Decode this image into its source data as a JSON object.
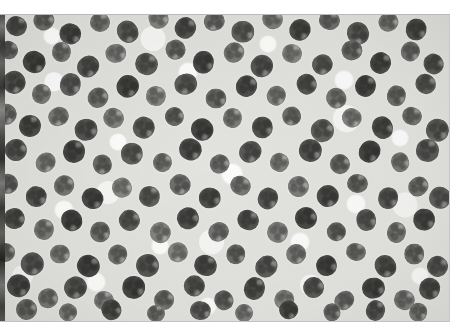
{
  "figure": {
    "kind": "micrograph",
    "modality": "light-microscopy-grayscale",
    "caption": "",
    "title": "",
    "visible_text": "",
    "colors": {
      "page_background": "#ffffff",
      "plate_background": "#e6e6e3",
      "cell_dark": "#4a4a48",
      "cell_mid": "#6f6f6c",
      "cell_light": "#949491",
      "cell_core": "#3a3a38",
      "halo_white": "#ffffff",
      "left_artifact_dark": "#262626",
      "plate_border": "#c2c2bf"
    },
    "plate": {
      "x": 0,
      "y": 14,
      "width": 450,
      "height": 308
    },
    "margins": {
      "top": 14,
      "right": 15,
      "bottom": 14,
      "left": 0
    }
  },
  "cells": [
    {
      "x": 16,
      "y": 12,
      "r": 11,
      "tone": 0.82,
      "rot": 18
    },
    {
      "x": 44,
      "y": 6,
      "r": 10,
      "tone": 0.74,
      "rot": 61
    },
    {
      "x": 70,
      "y": 20,
      "r": 11,
      "tone": 0.86,
      "rot": 110
    },
    {
      "x": 100,
      "y": 8,
      "r": 10,
      "tone": 0.7,
      "rot": 5
    },
    {
      "x": 128,
      "y": 18,
      "r": 11,
      "tone": 0.8,
      "rot": 143
    },
    {
      "x": 158,
      "y": 4,
      "r": 10,
      "tone": 0.66,
      "rot": 77
    },
    {
      "x": 186,
      "y": 14,
      "r": 11,
      "tone": 0.84,
      "rot": 29
    },
    {
      "x": 214,
      "y": 7,
      "r": 10,
      "tone": 0.72,
      "rot": 165
    },
    {
      "x": 243,
      "y": 18,
      "r": 11,
      "tone": 0.78,
      "rot": 92
    },
    {
      "x": 272,
      "y": 5,
      "r": 10,
      "tone": 0.68,
      "rot": 40
    },
    {
      "x": 300,
      "y": 16,
      "r": 11,
      "tone": 0.86,
      "rot": 124
    },
    {
      "x": 330,
      "y": 6,
      "r": 10,
      "tone": 0.73,
      "rot": 14
    },
    {
      "x": 358,
      "y": 19,
      "r": 11,
      "tone": 0.81,
      "rot": 152
    },
    {
      "x": 388,
      "y": 8,
      "r": 10,
      "tone": 0.69,
      "rot": 68
    },
    {
      "x": 416,
      "y": 16,
      "r": 11,
      "tone": 0.85,
      "rot": 101
    },
    {
      "x": 8,
      "y": 36,
      "r": 10,
      "tone": 0.76,
      "rot": 33
    },
    {
      "x": 34,
      "y": 48,
      "r": 11,
      "tone": 0.88,
      "rot": 119
    },
    {
      "x": 62,
      "y": 38,
      "r": 10,
      "tone": 0.71,
      "rot": 7
    },
    {
      "x": 88,
      "y": 52,
      "r": 11,
      "tone": 0.83,
      "rot": 136
    },
    {
      "x": 116,
      "y": 40,
      "r": 10,
      "tone": 0.67,
      "rot": 84
    },
    {
      "x": 146,
      "y": 50,
      "r": 11,
      "tone": 0.8,
      "rot": 22
    },
    {
      "x": 176,
      "y": 36,
      "r": 10,
      "tone": 0.74,
      "rot": 158
    },
    {
      "x": 204,
      "y": 48,
      "r": 11,
      "tone": 0.87,
      "rot": 95
    },
    {
      "x": 234,
      "y": 38,
      "r": 10,
      "tone": 0.7,
      "rot": 46
    },
    {
      "x": 262,
      "y": 52,
      "r": 11,
      "tone": 0.82,
      "rot": 131
    },
    {
      "x": 292,
      "y": 40,
      "r": 10,
      "tone": 0.65,
      "rot": 11
    },
    {
      "x": 322,
      "y": 50,
      "r": 11,
      "tone": 0.79,
      "rot": 148
    },
    {
      "x": 352,
      "y": 36,
      "r": 10,
      "tone": 0.75,
      "rot": 73
    },
    {
      "x": 380,
      "y": 49,
      "r": 11,
      "tone": 0.86,
      "rot": 27
    },
    {
      "x": 410,
      "y": 38,
      "r": 10,
      "tone": 0.72,
      "rot": 114
    },
    {
      "x": 434,
      "y": 50,
      "r": 11,
      "tone": 0.81,
      "rot": 59
    },
    {
      "x": 14,
      "y": 68,
      "r": 11,
      "tone": 0.84,
      "rot": 140
    },
    {
      "x": 42,
      "y": 80,
      "r": 10,
      "tone": 0.69,
      "rot": 16
    },
    {
      "x": 70,
      "y": 70,
      "r": 11,
      "tone": 0.78,
      "rot": 103
    },
    {
      "x": 98,
      "y": 84,
      "r": 10,
      "tone": 0.73,
      "rot": 51
    },
    {
      "x": 128,
      "y": 72,
      "r": 11,
      "tone": 0.88,
      "rot": 127
    },
    {
      "x": 156,
      "y": 82,
      "r": 10,
      "tone": 0.66,
      "rot": 9
    },
    {
      "x": 186,
      "y": 70,
      "r": 11,
      "tone": 0.8,
      "rot": 163
    },
    {
      "x": 216,
      "y": 84,
      "r": 10,
      "tone": 0.75,
      "rot": 88
    },
    {
      "x": 246,
      "y": 72,
      "r": 11,
      "tone": 0.85,
      "rot": 35
    },
    {
      "x": 276,
      "y": 82,
      "r": 10,
      "tone": 0.68,
      "rot": 118
    },
    {
      "x": 306,
      "y": 70,
      "r": 11,
      "tone": 0.82,
      "rot": 64
    },
    {
      "x": 336,
      "y": 84,
      "r": 10,
      "tone": 0.71,
      "rot": 145
    },
    {
      "x": 366,
      "y": 72,
      "r": 11,
      "tone": 0.87,
      "rot": 21
    },
    {
      "x": 396,
      "y": 82,
      "r": 10,
      "tone": 0.74,
      "rot": 98
    },
    {
      "x": 426,
      "y": 70,
      "r": 11,
      "tone": 0.79,
      "rot": 42
    },
    {
      "x": 6,
      "y": 100,
      "r": 10,
      "tone": 0.72,
      "rot": 130
    },
    {
      "x": 30,
      "y": 112,
      "r": 11,
      "tone": 0.86,
      "rot": 6
    },
    {
      "x": 58,
      "y": 102,
      "r": 10,
      "tone": 0.7,
      "rot": 155
    },
    {
      "x": 86,
      "y": 116,
      "r": 11,
      "tone": 0.83,
      "rot": 80
    },
    {
      "x": 114,
      "y": 104,
      "r": 10,
      "tone": 0.67,
      "rot": 26
    },
    {
      "x": 144,
      "y": 114,
      "r": 11,
      "tone": 0.81,
      "rot": 112
    },
    {
      "x": 174,
      "y": 102,
      "r": 10,
      "tone": 0.76,
      "rot": 57
    },
    {
      "x": 202,
      "y": 116,
      "r": 11,
      "tone": 0.88,
      "rot": 138
    },
    {
      "x": 232,
      "y": 104,
      "r": 10,
      "tone": 0.69,
      "rot": 13
    },
    {
      "x": 262,
      "y": 114,
      "r": 11,
      "tone": 0.84,
      "rot": 91
    },
    {
      "x": 292,
      "y": 102,
      "r": 10,
      "tone": 0.73,
      "rot": 167
    },
    {
      "x": 322,
      "y": 116,
      "r": 11,
      "tone": 0.78,
      "rot": 48
    },
    {
      "x": 352,
      "y": 104,
      "r": 10,
      "tone": 0.66,
      "rot": 123
    },
    {
      "x": 382,
      "y": 114,
      "r": 11,
      "tone": 0.85,
      "rot": 70
    },
    {
      "x": 412,
      "y": 102,
      "r": 10,
      "tone": 0.71,
      "rot": 19
    },
    {
      "x": 438,
      "y": 116,
      "r": 11,
      "tone": 0.8,
      "rot": 106
    },
    {
      "x": 16,
      "y": 136,
      "r": 11,
      "tone": 0.82,
      "rot": 53
    },
    {
      "x": 46,
      "y": 148,
      "r": 10,
      "tone": 0.68,
      "rot": 134
    },
    {
      "x": 74,
      "y": 138,
      "r": 11,
      "tone": 0.87,
      "rot": 10
    },
    {
      "x": 102,
      "y": 150,
      "r": 10,
      "tone": 0.75,
      "rot": 160
    },
    {
      "x": 132,
      "y": 140,
      "r": 11,
      "tone": 0.79,
      "rot": 85
    },
    {
      "x": 162,
      "y": 148,
      "r": 10,
      "tone": 0.7,
      "rot": 31
    },
    {
      "x": 190,
      "y": 136,
      "r": 11,
      "tone": 0.86,
      "rot": 117
    },
    {
      "x": 220,
      "y": 150,
      "r": 10,
      "tone": 0.72,
      "rot": 62
    },
    {
      "x": 250,
      "y": 138,
      "r": 11,
      "tone": 0.81,
      "rot": 143
    },
    {
      "x": 280,
      "y": 148,
      "r": 10,
      "tone": 0.67,
      "rot": 24
    },
    {
      "x": 310,
      "y": 136,
      "r": 11,
      "tone": 0.84,
      "rot": 100
    },
    {
      "x": 340,
      "y": 150,
      "r": 10,
      "tone": 0.74,
      "rot": 45
    },
    {
      "x": 370,
      "y": 138,
      "r": 11,
      "tone": 0.88,
      "rot": 128
    },
    {
      "x": 400,
      "y": 148,
      "r": 10,
      "tone": 0.69,
      "rot": 74
    },
    {
      "x": 428,
      "y": 136,
      "r": 11,
      "tone": 0.8,
      "rot": 8
    },
    {
      "x": 8,
      "y": 170,
      "r": 10,
      "tone": 0.76,
      "rot": 150
    },
    {
      "x": 36,
      "y": 182,
      "r": 11,
      "tone": 0.83,
      "rot": 96
    },
    {
      "x": 64,
      "y": 172,
      "r": 10,
      "tone": 0.71,
      "rot": 37
    },
    {
      "x": 92,
      "y": 184,
      "r": 11,
      "tone": 0.87,
      "rot": 121
    },
    {
      "x": 122,
      "y": 174,
      "r": 10,
      "tone": 0.65,
      "rot": 66
    },
    {
      "x": 150,
      "y": 182,
      "r": 11,
      "tone": 0.79,
      "rot": 12
    },
    {
      "x": 180,
      "y": 170,
      "r": 10,
      "tone": 0.73,
      "rot": 141
    },
    {
      "x": 210,
      "y": 184,
      "r": 11,
      "tone": 0.85,
      "rot": 88
    },
    {
      "x": 240,
      "y": 172,
      "r": 10,
      "tone": 0.7,
      "rot": 30
    },
    {
      "x": 268,
      "y": 184,
      "r": 11,
      "tone": 0.82,
      "rot": 113
    },
    {
      "x": 298,
      "y": 172,
      "r": 10,
      "tone": 0.68,
      "rot": 58
    },
    {
      "x": 328,
      "y": 182,
      "r": 11,
      "tone": 0.86,
      "rot": 136
    },
    {
      "x": 358,
      "y": 170,
      "r": 10,
      "tone": 0.75,
      "rot": 3
    },
    {
      "x": 388,
      "y": 184,
      "r": 11,
      "tone": 0.81,
      "rot": 104
    },
    {
      "x": 418,
      "y": 172,
      "r": 10,
      "tone": 0.72,
      "rot": 49
    },
    {
      "x": 440,
      "y": 184,
      "r": 11,
      "tone": 0.78,
      "rot": 126
    },
    {
      "x": 14,
      "y": 204,
      "r": 11,
      "tone": 0.84,
      "rot": 71
    },
    {
      "x": 44,
      "y": 216,
      "r": 10,
      "tone": 0.69,
      "rot": 17
    },
    {
      "x": 72,
      "y": 206,
      "r": 11,
      "tone": 0.88,
      "rot": 146
    },
    {
      "x": 100,
      "y": 218,
      "r": 10,
      "tone": 0.74,
      "rot": 93
    },
    {
      "x": 130,
      "y": 206,
      "r": 11,
      "tone": 0.8,
      "rot": 39
    },
    {
      "x": 160,
      "y": 218,
      "r": 10,
      "tone": 0.66,
      "rot": 119
    },
    {
      "x": 188,
      "y": 204,
      "r": 11,
      "tone": 0.85,
      "rot": 64
    },
    {
      "x": 218,
      "y": 218,
      "r": 10,
      "tone": 0.71,
      "rot": 152
    },
    {
      "x": 248,
      "y": 206,
      "r": 11,
      "tone": 0.83,
      "rot": 25
    },
    {
      "x": 278,
      "y": 218,
      "r": 10,
      "tone": 0.67,
      "rot": 108
    },
    {
      "x": 306,
      "y": 204,
      "r": 11,
      "tone": 0.87,
      "rot": 55
    },
    {
      "x": 336,
      "y": 218,
      "r": 10,
      "tone": 0.76,
      "rot": 132
    },
    {
      "x": 366,
      "y": 206,
      "r": 11,
      "tone": 0.79,
      "rot": 80
    },
    {
      "x": 396,
      "y": 218,
      "r": 10,
      "tone": 0.7,
      "rot": 15
    },
    {
      "x": 424,
      "y": 206,
      "r": 11,
      "tone": 0.86,
      "rot": 99
    },
    {
      "x": 6,
      "y": 238,
      "r": 10,
      "tone": 0.73,
      "rot": 44
    },
    {
      "x": 32,
      "y": 250,
      "r": 11,
      "tone": 0.81,
      "rot": 139
    },
    {
      "x": 60,
      "y": 240,
      "r": 10,
      "tone": 0.68,
      "rot": 86
    },
    {
      "x": 88,
      "y": 252,
      "r": 11,
      "tone": 0.88,
      "rot": 28
    },
    {
      "x": 118,
      "y": 240,
      "r": 10,
      "tone": 0.72,
      "rot": 115
    },
    {
      "x": 148,
      "y": 252,
      "r": 11,
      "tone": 0.82,
      "rot": 60
    },
    {
      "x": 178,
      "y": 238,
      "r": 10,
      "tone": 0.65,
      "rot": 157
    },
    {
      "x": 206,
      "y": 252,
      "r": 11,
      "tone": 0.85,
      "rot": 20
    },
    {
      "x": 236,
      "y": 240,
      "r": 10,
      "tone": 0.75,
      "rot": 102
    },
    {
      "x": 266,
      "y": 252,
      "r": 11,
      "tone": 0.8,
      "rot": 47
    },
    {
      "x": 296,
      "y": 240,
      "r": 10,
      "tone": 0.69,
      "rot": 129
    },
    {
      "x": 326,
      "y": 252,
      "r": 11,
      "tone": 0.87,
      "rot": 76
    },
    {
      "x": 356,
      "y": 238,
      "r": 10,
      "tone": 0.71,
      "rot": 11
    },
    {
      "x": 386,
      "y": 252,
      "r": 11,
      "tone": 0.83,
      "rot": 144
    },
    {
      "x": 414,
      "y": 240,
      "r": 10,
      "tone": 0.74,
      "rot": 90
    },
    {
      "x": 438,
      "y": 252,
      "r": 11,
      "tone": 0.79,
      "rot": 34
    },
    {
      "x": 18,
      "y": 272,
      "r": 11,
      "tone": 0.86,
      "rot": 122
    },
    {
      "x": 48,
      "y": 284,
      "r": 10,
      "tone": 0.7,
      "rot": 68
    },
    {
      "x": 76,
      "y": 274,
      "r": 11,
      "tone": 0.82,
      "rot": 149
    },
    {
      "x": 104,
      "y": 286,
      "r": 10,
      "tone": 0.67,
      "rot": 7
    },
    {
      "x": 134,
      "y": 274,
      "r": 11,
      "tone": 0.88,
      "rot": 97
    },
    {
      "x": 164,
      "y": 286,
      "r": 10,
      "tone": 0.73,
      "rot": 41
    },
    {
      "x": 194,
      "y": 272,
      "r": 11,
      "tone": 0.81,
      "rot": 135
    },
    {
      "x": 224,
      "y": 286,
      "r": 10,
      "tone": 0.76,
      "rot": 63
    },
    {
      "x": 254,
      "y": 274,
      "r": 11,
      "tone": 0.84,
      "rot": 18
    },
    {
      "x": 284,
      "y": 286,
      "r": 10,
      "tone": 0.66,
      "rot": 111
    },
    {
      "x": 314,
      "y": 274,
      "r": 11,
      "tone": 0.8,
      "rot": 52
    },
    {
      "x": 344,
      "y": 286,
      "r": 10,
      "tone": 0.72,
      "rot": 140
    },
    {
      "x": 374,
      "y": 274,
      "r": 11,
      "tone": 0.87,
      "rot": 83
    },
    {
      "x": 404,
      "y": 286,
      "r": 10,
      "tone": 0.68,
      "rot": 23
    },
    {
      "x": 430,
      "y": 274,
      "r": 11,
      "tone": 0.83,
      "rot": 107
    },
    {
      "x": 26,
      "y": 296,
      "r": 10,
      "tone": 0.74,
      "rot": 50
    },
    {
      "x": 68,
      "y": 298,
      "r": 9,
      "tone": 0.69,
      "rot": 125
    },
    {
      "x": 112,
      "y": 296,
      "r": 10,
      "tone": 0.85,
      "rot": 72
    },
    {
      "x": 156,
      "y": 299,
      "r": 9,
      "tone": 0.71,
      "rot": 4
    },
    {
      "x": 200,
      "y": 296,
      "r": 10,
      "tone": 0.79,
      "rot": 95
    },
    {
      "x": 244,
      "y": 299,
      "r": 9,
      "tone": 0.67,
      "rot": 38
    },
    {
      "x": 288,
      "y": 296,
      "r": 10,
      "tone": 0.86,
      "rot": 131
    },
    {
      "x": 332,
      "y": 298,
      "r": 9,
      "tone": 0.73,
      "rot": 79
    },
    {
      "x": 376,
      "y": 296,
      "r": 10,
      "tone": 0.81,
      "rot": 16
    },
    {
      "x": 418,
      "y": 298,
      "r": 9,
      "tone": 0.7,
      "rot": 103
    }
  ],
  "halos": [
    {
      "x": 52,
      "y": 22,
      "r": 9
    },
    {
      "x": 188,
      "y": 58,
      "r": 10
    },
    {
      "x": 268,
      "y": 30,
      "r": 9
    },
    {
      "x": 344,
      "y": 66,
      "r": 10
    },
    {
      "x": 118,
      "y": 128,
      "r": 9
    },
    {
      "x": 232,
      "y": 160,
      "r": 11
    },
    {
      "x": 400,
      "y": 124,
      "r": 9
    },
    {
      "x": 64,
      "y": 196,
      "r": 10
    },
    {
      "x": 160,
      "y": 232,
      "r": 9
    },
    {
      "x": 300,
      "y": 228,
      "r": 10
    },
    {
      "x": 420,
      "y": 262,
      "r": 9
    },
    {
      "x": 96,
      "y": 268,
      "r": 10
    },
    {
      "x": 208,
      "y": 292,
      "r": 9
    },
    {
      "x": 356,
      "y": 190,
      "r": 10
    }
  ]
}
